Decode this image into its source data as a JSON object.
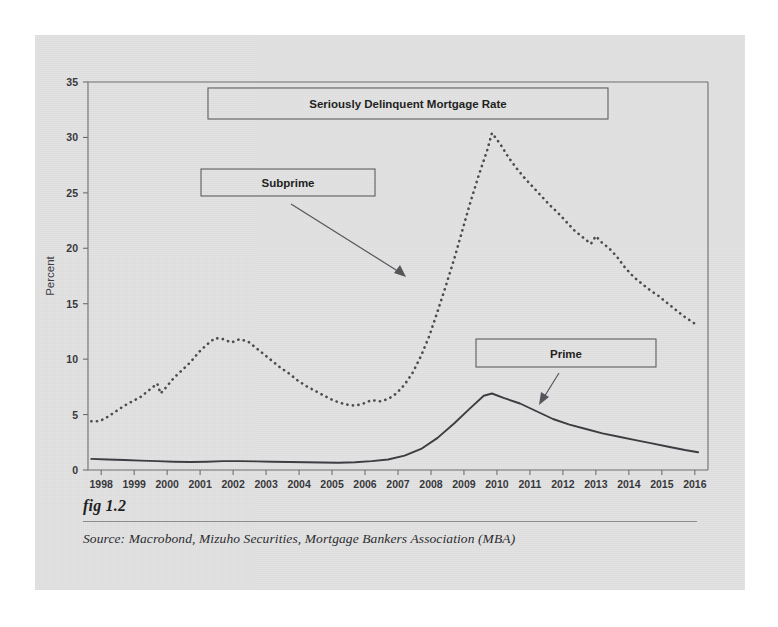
{
  "figure": {
    "number_label": "fig 1.2",
    "source_line": "Source:  Macrobond, Mizuho Securities, Mortgage Bankers Association (MBA)"
  },
  "callouts": {
    "title": "Seriously Delinquent Mortgage Rate",
    "subprime": "Subprime",
    "prime": "Prime"
  },
  "colors": {
    "card_background": "#e3e3e3",
    "page_background": "#ffffff",
    "axis": "#6f6f72",
    "prime_series": "#3b3b40",
    "subprime_series": "#4a4a50",
    "callout_border": "#5d5d62",
    "text": "#1d1d20"
  },
  "chart_data": {
    "type": "line",
    "title": "Seriously Delinquent Mortgage Rate",
    "xlabel": "",
    "ylabel": "Percent",
    "xlim": [
      1997.6,
      2016.4
    ],
    "ylim": [
      0,
      35
    ],
    "yticks": [
      0,
      5,
      10,
      15,
      20,
      25,
      30,
      35
    ],
    "xticks": [
      1998,
      1999,
      2000,
      2001,
      2002,
      2003,
      2004,
      2005,
      2006,
      2007,
      2008,
      2009,
      2010,
      2011,
      2012,
      2013,
      2014,
      2015,
      2016
    ],
    "xtick_labels": [
      "1998",
      "1999",
      "2000",
      "2001",
      "2002",
      "2003",
      "2004",
      "2005",
      "2006",
      "2007",
      "2008",
      "2009",
      "2010",
      "2011",
      "2012",
      "2013",
      "2014",
      "2015",
      "2016"
    ],
    "grid": false,
    "legend": "annotated callout boxes with leader arrows",
    "annotations": [
      {
        "text": "Seriously Delinquent Mortgage Rate",
        "role": "title-box"
      },
      {
        "text": "Subprime",
        "role": "series-label",
        "points_to": "subprime"
      },
      {
        "text": "Prime",
        "role": "series-label",
        "points_to": "prime"
      }
    ],
    "series": [
      {
        "name": "Subprime",
        "style": "dotted",
        "x": [
          1997.7,
          1997.95,
          1998.2,
          1998.45,
          1998.7,
          1998.95,
          1999.2,
          1999.45,
          1999.7,
          1999.8,
          1999.95,
          2000.2,
          2000.45,
          2000.7,
          2000.95,
          2001.2,
          2001.45,
          2001.7,
          2001.95,
          2002.2,
          2002.45,
          2002.7,
          2002.95,
          2003.2,
          2003.45,
          2003.7,
          2003.95,
          2004.2,
          2004.45,
          2004.7,
          2004.95,
          2005.2,
          2005.45,
          2005.7,
          2005.95,
          2006.2,
          2006.45,
          2006.7,
          2006.95,
          2007.2,
          2007.45,
          2007.7,
          2007.95,
          2008.2,
          2008.45,
          2008.7,
          2008.95,
          2009.2,
          2009.45,
          2009.7,
          2009.85,
          2010.1,
          2010.35,
          2010.6,
          2010.85,
          2011.1,
          2011.35,
          2011.6,
          2011.85,
          2012.1,
          2012.35,
          2012.6,
          2012.85,
          2013.0,
          2013.15,
          2013.4,
          2013.65,
          2013.9,
          2014.15,
          2014.4,
          2014.65,
          2014.9,
          2015.15,
          2015.4,
          2015.65,
          2015.9,
          2016.1
        ],
        "y": [
          4.4,
          4.4,
          4.8,
          5.3,
          5.8,
          6.2,
          6.6,
          7.2,
          7.8,
          6.9,
          7.4,
          8.3,
          9.0,
          9.7,
          10.6,
          11.3,
          11.9,
          11.8,
          11.5,
          11.8,
          11.6,
          11.0,
          10.4,
          9.8,
          9.2,
          8.7,
          8.1,
          7.6,
          7.2,
          6.8,
          6.4,
          6.1,
          5.9,
          5.8,
          6.0,
          6.3,
          6.2,
          6.4,
          6.9,
          7.7,
          8.8,
          10.3,
          12.1,
          14.3,
          16.6,
          19.0,
          21.6,
          24.2,
          26.6,
          28.8,
          30.4,
          29.4,
          28.2,
          27.2,
          26.3,
          25.5,
          24.7,
          23.9,
          23.2,
          22.4,
          21.6,
          21.0,
          20.4,
          21.1,
          20.6,
          20.0,
          19.2,
          18.2,
          17.4,
          16.8,
          16.2,
          15.7,
          15.1,
          14.5,
          13.9,
          13.4,
          13.0
        ]
      },
      {
        "name": "Prime",
        "style": "solid",
        "x": [
          1997.7,
          1998.2,
          1998.7,
          1999.2,
          1999.7,
          2000.2,
          2000.7,
          2001.2,
          2001.7,
          2002.2,
          2002.7,
          2003.2,
          2003.7,
          2004.2,
          2004.7,
          2005.2,
          2005.7,
          2006.2,
          2006.7,
          2007.2,
          2007.7,
          2008.2,
          2008.7,
          2009.2,
          2009.6,
          2009.85,
          2010.2,
          2010.7,
          2011.2,
          2011.7,
          2012.2,
          2012.7,
          2013.2,
          2013.7,
          2014.2,
          2014.7,
          2015.2,
          2015.7,
          2016.1
        ],
        "y": [
          1.0,
          0.95,
          0.9,
          0.85,
          0.8,
          0.75,
          0.72,
          0.75,
          0.8,
          0.8,
          0.78,
          0.75,
          0.72,
          0.7,
          0.68,
          0.66,
          0.7,
          0.8,
          0.95,
          1.3,
          1.9,
          2.9,
          4.2,
          5.6,
          6.7,
          6.9,
          6.5,
          6.0,
          5.3,
          4.6,
          4.1,
          3.7,
          3.3,
          3.0,
          2.7,
          2.4,
          2.1,
          1.8,
          1.6
        ]
      }
    ]
  }
}
